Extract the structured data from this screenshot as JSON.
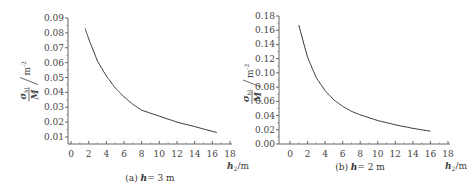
{
  "chart_data": [
    {
      "type": "line",
      "title": "(a) h = 3 m",
      "caption_prefix": "(a)",
      "caption_var": "h",
      "caption_value": "= 3 m",
      "xlabel": "h2/m",
      "ylabel": "σh1 / M / m^-2",
      "xlim": [
        0,
        18
      ],
      "ylim": [
        0.01,
        0.09
      ],
      "xticks": [
        "0",
        "2",
        "4",
        "6",
        "8",
        "10",
        "12",
        "14",
        "16",
        "18"
      ],
      "yticks": [
        "0.09",
        "0.08",
        "0.07",
        "0.06",
        "0.05",
        "0.04",
        "0.03",
        "0.02",
        "0.01"
      ],
      "grid": false,
      "series": [
        {
          "name": "h=3 m",
          "x": [
            1.6,
            2,
            3,
            4,
            5,
            6,
            7,
            8,
            10,
            12,
            14,
            16.5
          ],
          "y": [
            0.083,
            0.076,
            0.061,
            0.051,
            0.043,
            0.037,
            0.032,
            0.028,
            0.024,
            0.02,
            0.017,
            0.013
          ]
        }
      ]
    },
    {
      "type": "line",
      "title": "(b) h = 2 m",
      "caption_prefix": "(b)",
      "caption_var": "h",
      "caption_value": "= 2 m",
      "xlabel": "h2/m",
      "ylabel": "σh1 / M / m^-2",
      "xlim": [
        0,
        18
      ],
      "ylim": [
        0.0,
        0.18
      ],
      "xticks": [
        "0",
        "2",
        "4",
        "6",
        "8",
        "10",
        "12",
        "14",
        "16",
        "18"
      ],
      "yticks": [
        "0.18",
        "0.16",
        "0.14",
        "0.12",
        "0.10",
        "0.08",
        "0.06",
        "0.04",
        "0.02",
        "0.00"
      ],
      "grid": false,
      "series": [
        {
          "name": "h=2 m",
          "x": [
            1,
            2,
            3,
            4,
            5,
            6,
            7,
            8,
            10,
            12,
            14,
            16
          ],
          "y": [
            0.167,
            0.122,
            0.093,
            0.075,
            0.062,
            0.053,
            0.046,
            0.041,
            0.033,
            0.027,
            0.022,
            0.018
          ]
        }
      ]
    }
  ]
}
